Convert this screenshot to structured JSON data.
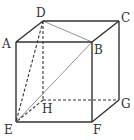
{
  "diagram": {
    "type": "cube",
    "vertices": {
      "A": {
        "label": "A",
        "x": 16,
        "y": 42,
        "lx": 2,
        "ly": 48
      },
      "B": {
        "label": "B",
        "x": 92,
        "y": 42,
        "lx": 94,
        "ly": 54
      },
      "C": {
        "label": "C",
        "x": 119,
        "y": 21,
        "lx": 121,
        "ly": 22
      },
      "D": {
        "label": "D",
        "x": 43,
        "y": 21,
        "lx": 36,
        "ly": 17
      },
      "E": {
        "label": "E",
        "x": 16,
        "y": 122,
        "lx": 4,
        "ly": 134
      },
      "F": {
        "label": "F",
        "x": 92,
        "y": 122,
        "lx": 93,
        "ly": 134
      },
      "G": {
        "label": "G",
        "x": 119,
        "y": 100,
        "lx": 121,
        "ly": 108
      },
      "H": {
        "label": "H",
        "x": 43,
        "y": 100,
        "lx": 42,
        "ly": 113
      }
    },
    "solid_edges": [
      "AB",
      "BC",
      "CD",
      "DA",
      "AE",
      "EF",
      "FB",
      "FG",
      "GC"
    ],
    "dashed_edges": [
      "DH",
      "HE",
      "HG",
      "DE"
    ],
    "thin_edges": [
      "DB",
      "EB"
    ],
    "colors": {
      "edge": "#333333",
      "thin": "#777777"
    }
  }
}
